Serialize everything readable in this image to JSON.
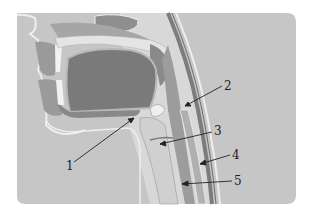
{
  "figure": {
    "type": "anatomical cross-section",
    "background_color": "#c4c4c4",
    "labels": [
      {
        "id": "1",
        "text": "1",
        "x": 69,
        "y": 170
      },
      {
        "id": "2",
        "text": "2",
        "x": 226,
        "y": 90
      },
      {
        "id": "3",
        "text": "3",
        "x": 216,
        "y": 135
      },
      {
        "id": "4",
        "text": "4",
        "x": 234,
        "y": 159
      },
      {
        "id": "5",
        "text": "5",
        "x": 236,
        "y": 185
      }
    ]
  }
}
